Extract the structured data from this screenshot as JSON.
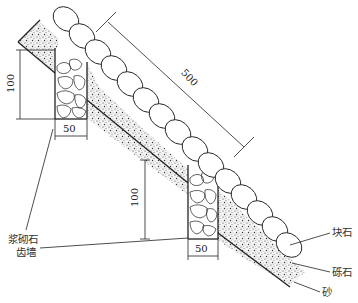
{
  "diagram": {
    "title": "",
    "labels": {
      "block_stone": "块石",
      "gravel": "砾石",
      "sand": "砂",
      "retaining_wall_line1": "浆砌石",
      "retaining_wall_line2": "齿墙"
    },
    "dimensions": {
      "slope_length": "500",
      "upper_wall_height": "100",
      "upper_wall_width": "50",
      "lower_wall_height": "100",
      "lower_wall_width": "50"
    },
    "colors": {
      "line": "#222222",
      "background": "#ffffff",
      "stipple": "#555555"
    }
  }
}
